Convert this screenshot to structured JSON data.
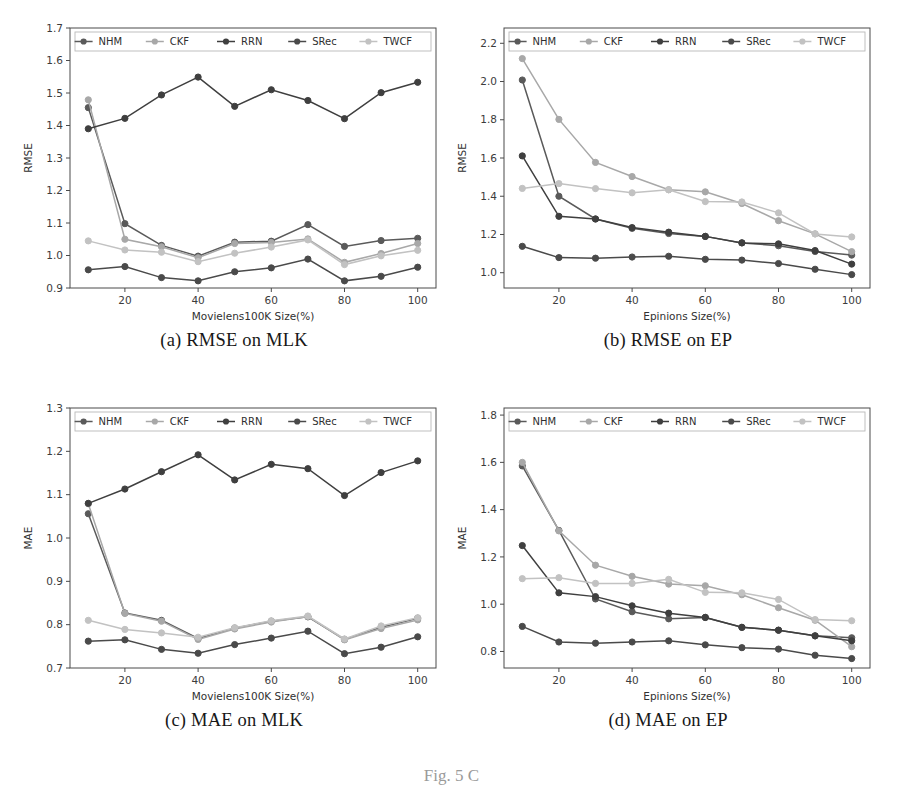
{
  "figure": {
    "label": "Fig. 5  C",
    "series_names": [
      "NHM",
      "CKF",
      "RRN",
      "SRec",
      "TWCF"
    ],
    "series_colors": [
      "#5a5a5a",
      "#a8a8a8",
      "#3f3f3f",
      "#4a4a4a",
      "#c2c2c2"
    ],
    "captions": {
      "a": "(a) RMSE on MLK",
      "b": "(b) RMSE on EP",
      "c": "(c) MAE on MLK",
      "d": "(d) MAE on EP"
    }
  },
  "chart_data": [
    {
      "id": "a",
      "type": "line",
      "title": "(a) RMSE on MLK",
      "xlabel": "Movielens100K Size(%)",
      "ylabel": "RMSE",
      "x": [
        10,
        20,
        30,
        40,
        50,
        60,
        70,
        80,
        90,
        100
      ],
      "xticks": [
        20,
        40,
        60,
        80,
        100
      ],
      "yticks": [
        0.9,
        1.0,
        1.1,
        1.2,
        1.3,
        1.4,
        1.5,
        1.6,
        1.7
      ],
      "xlim": [
        5,
        105
      ],
      "ylim": [
        0.9,
        1.7
      ],
      "grid": false,
      "legend": "upper-inside",
      "series": [
        {
          "name": "NHM",
          "values": [
            1.455,
            1.098,
            1.031,
            0.998,
            1.041,
            1.044,
            1.095,
            1.028,
            1.046,
            1.053
          ]
        },
        {
          "name": "CKF",
          "values": [
            1.479,
            1.05,
            1.027,
            0.993,
            1.037,
            1.04,
            1.051,
            0.979,
            1.006,
            1.037
          ]
        },
        {
          "name": "RRN",
          "values": [
            1.39,
            1.422,
            1.494,
            1.549,
            1.459,
            1.51,
            1.477,
            1.421,
            1.501,
            1.533
          ]
        },
        {
          "name": "SRec",
          "values": [
            0.956,
            0.966,
            0.932,
            0.922,
            0.95,
            0.962,
            0.989,
            0.922,
            0.936,
            0.964
          ]
        },
        {
          "name": "TWCF",
          "values": [
            1.045,
            1.017,
            1.01,
            0.981,
            1.007,
            1.026,
            1.048,
            0.972,
            0.999,
            1.016
          ]
        }
      ]
    },
    {
      "id": "b",
      "type": "line",
      "title": "(b) RMSE on EP",
      "xlabel": "Epinions Size(%)",
      "ylabel": "RMSE",
      "x": [
        10,
        20,
        30,
        40,
        50,
        60,
        70,
        80,
        90,
        100
      ],
      "xticks": [
        20,
        40,
        60,
        80,
        100
      ],
      "yticks": [
        1.0,
        1.2,
        1.4,
        1.6,
        1.8,
        2.0,
        2.2
      ],
      "xlim": [
        5,
        105
      ],
      "ylim": [
        0.92,
        2.28
      ],
      "grid": false,
      "legend": "upper-inside",
      "series": [
        {
          "name": "NHM",
          "values": [
            2.008,
            1.4,
            1.281,
            1.232,
            1.205,
            1.19,
            1.156,
            1.141,
            1.111,
            1.092
          ]
        },
        {
          "name": "CKF",
          "values": [
            2.12,
            1.802,
            1.577,
            1.503,
            1.434,
            1.423,
            1.362,
            1.272,
            1.203,
            1.11
          ]
        },
        {
          "name": "RRN",
          "values": [
            1.611,
            1.295,
            1.281,
            1.236,
            1.212,
            1.19,
            1.156,
            1.151,
            1.116,
            1.045
          ]
        },
        {
          "name": "SRec",
          "values": [
            1.138,
            1.079,
            1.076,
            1.082,
            1.086,
            1.07,
            1.066,
            1.048,
            1.018,
            0.99
          ]
        },
        {
          "name": "TWCF",
          "values": [
            1.441,
            1.466,
            1.44,
            1.418,
            1.434,
            1.372,
            1.37,
            1.313,
            1.203,
            1.187
          ]
        }
      ]
    },
    {
      "id": "c",
      "type": "line",
      "title": "(c) MAE on MLK",
      "xlabel": "Movielens100K Size(%)",
      "ylabel": "MAE",
      "x": [
        10,
        20,
        30,
        40,
        50,
        60,
        70,
        80,
        90,
        100
      ],
      "xticks": [
        20,
        40,
        60,
        80,
        100
      ],
      "yticks": [
        0.7,
        0.8,
        0.9,
        1.0,
        1.1,
        1.2,
        1.3
      ],
      "xlim": [
        5,
        105
      ],
      "ylim": [
        0.7,
        1.3
      ],
      "grid": false,
      "legend": "upper-inside",
      "series": [
        {
          "name": "NHM",
          "values": [
            1.056,
            0.827,
            0.81,
            0.768,
            0.792,
            0.808,
            0.818,
            0.766,
            0.794,
            0.815
          ]
        },
        {
          "name": "CKF",
          "values": [
            1.079,
            0.826,
            0.808,
            0.766,
            0.79,
            0.806,
            0.819,
            0.765,
            0.791,
            0.811
          ]
        },
        {
          "name": "RRN",
          "values": [
            1.08,
            1.113,
            1.153,
            1.192,
            1.134,
            1.17,
            1.16,
            1.098,
            1.151,
            1.178
          ]
        },
        {
          "name": "SRec",
          "values": [
            0.762,
            0.765,
            0.743,
            0.734,
            0.754,
            0.769,
            0.785,
            0.733,
            0.748,
            0.772
          ]
        },
        {
          "name": "TWCF",
          "values": [
            0.81,
            0.789,
            0.781,
            0.771,
            0.793,
            0.809,
            0.82,
            0.767,
            0.797,
            0.816
          ]
        }
      ]
    },
    {
      "id": "d",
      "type": "line",
      "title": "(d) MAE on EP",
      "xlabel": "Epinions Size(%)",
      "ylabel": "MAE",
      "x": [
        10,
        20,
        30,
        40,
        50,
        60,
        70,
        80,
        90,
        100
      ],
      "xticks": [
        20,
        40,
        60,
        80,
        100
      ],
      "yticks": [
        0.8,
        1.0,
        1.2,
        1.4,
        1.6,
        1.8
      ],
      "xlim": [
        5,
        105
      ],
      "ylim": [
        0.73,
        1.83
      ],
      "grid": false,
      "legend": "upper-inside",
      "series": [
        {
          "name": "NHM",
          "values": [
            1.585,
            1.312,
            1.022,
            0.968,
            0.938,
            0.944,
            0.902,
            0.89,
            0.866,
            0.858
          ]
        },
        {
          "name": "CKF",
          "values": [
            1.6,
            1.31,
            1.165,
            1.118,
            1.085,
            1.078,
            1.04,
            0.985,
            0.932,
            0.82
          ]
        },
        {
          "name": "RRN",
          "values": [
            1.248,
            1.048,
            1.032,
            0.993,
            0.962,
            0.944,
            0.902,
            0.89,
            0.866,
            0.845
          ]
        },
        {
          "name": "SRec",
          "values": [
            0.906,
            0.84,
            0.835,
            0.84,
            0.845,
            0.828,
            0.816,
            0.81,
            0.784,
            0.77
          ]
        },
        {
          "name": "TWCF",
          "values": [
            1.108,
            1.112,
            1.088,
            1.088,
            1.105,
            1.05,
            1.048,
            1.02,
            0.935,
            0.93
          ]
        }
      ]
    }
  ]
}
